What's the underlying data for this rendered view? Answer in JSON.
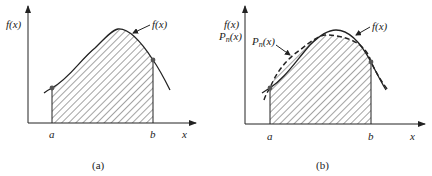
{
  "panels": [
    {
      "id": "a",
      "caption": "(a)",
      "y_axis_label": "f(x)",
      "curve_label": "f(x)",
      "x_axis_label": "x",
      "lower_limit_label": "a",
      "upper_limit_label": "b",
      "shaded_region": "area under f(x) from a to b"
    },
    {
      "id": "b",
      "caption": "(b)",
      "y_axis_label_1": "f(x)",
      "y_axis_label_2_main": "P",
      "y_axis_label_2_sub": "n",
      "y_axis_label_2_arg": "(x)",
      "curve_label": "f(x)",
      "poly_label_main": "P",
      "poly_label_sub": "n",
      "poly_label_arg": "(x)",
      "x_axis_label": "x",
      "lower_limit_label": "a",
      "upper_limit_label": "b",
      "shaded_region": "area under Pn(x) from a to b"
    }
  ],
  "colors": {
    "ink": "#222222",
    "background": "#ffffff"
  }
}
